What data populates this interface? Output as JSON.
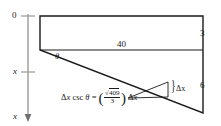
{
  "figure": {
    "stroke_color": "#1a1a1a",
    "axis_color": "#8a8a8a",
    "background": "#ffffff",
    "axis": {
      "name": "vertical-x-axis",
      "top_tick_label": "0",
      "mid_tick_label": "x",
      "arrow_label": "x",
      "arrow_direction": "down"
    },
    "labels": {
      "top_width": "40",
      "right_upper_height": "3",
      "right_lower_height": "6",
      "angle": "θ",
      "delta_x": "Δx"
    },
    "equation": {
      "lhs_delta": "Δ",
      "lhs_var": "x",
      "lhs_func": "csc",
      "lhs_angle": "θ",
      "equals": "=",
      "open_paren": "(",
      "radical": "√",
      "numerator": "409",
      "denominator": "3",
      "close_paren": ")",
      "rhs_delta": "Δ",
      "rhs_var": "x"
    }
  }
}
